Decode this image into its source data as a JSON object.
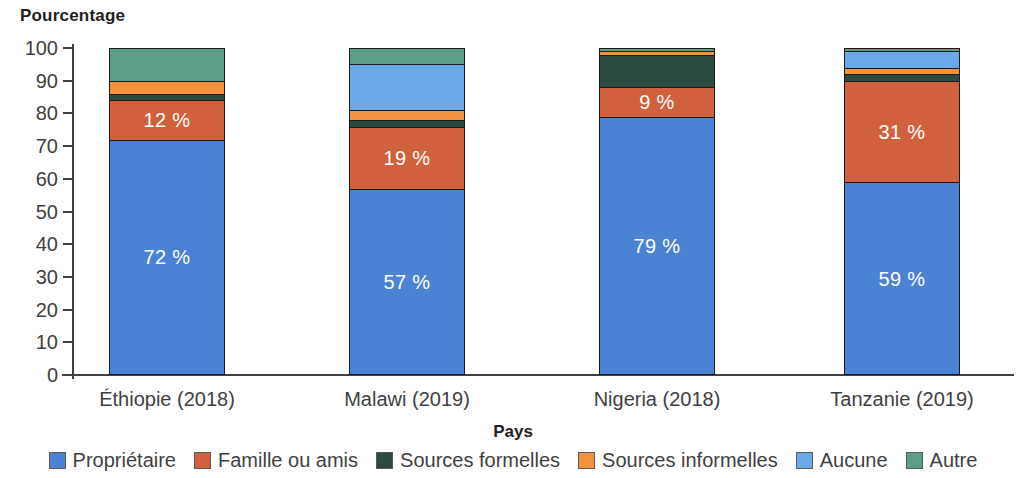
{
  "chart_data": {
    "type": "bar",
    "subtype": "stacked-bar-100",
    "title": "",
    "ylabel": "Pourcentage",
    "xlabel": "Pays",
    "ylim": [
      0,
      100
    ],
    "yticks": [
      0,
      10,
      20,
      30,
      40,
      50,
      60,
      70,
      80,
      90,
      100
    ],
    "ytick_labels": [
      "0",
      "10",
      "20",
      "30",
      "40",
      "50",
      "60",
      "70",
      "80",
      "90",
      "100"
    ],
    "grid": false,
    "legend_position": "bottom",
    "categories": [
      "Éthiopie (2018)",
      "Malawi (2019)",
      "Nigeria (2018)",
      "Tanzanie (2019)"
    ],
    "series": [
      {
        "name": "Propriétaire",
        "color": "#4a82d4",
        "values": [
          72,
          57,
          79,
          59
        ]
      },
      {
        "name": "Famille ou amis",
        "color": "#d1613c",
        "values": [
          12,
          19,
          9,
          31
        ]
      },
      {
        "name": "Sources formelles",
        "color": "#2d4a3e",
        "values": [
          2,
          2,
          10,
          2
        ]
      },
      {
        "name": "Sources informelles",
        "color": "#f2913e",
        "values": [
          4,
          3,
          1,
          2
        ]
      },
      {
        "name": "Aucune",
        "color": "#6aa8e8",
        "values": [
          0,
          14,
          0,
          5
        ]
      },
      {
        "name": "Autre",
        "color": "#5b9e85",
        "values": [
          10,
          5,
          1,
          1
        ]
      }
    ],
    "data_labels": [
      {
        "category": "Éthiopie (2018)",
        "series": "Propriétaire",
        "text": "72 %"
      },
      {
        "category": "Éthiopie (2018)",
        "series": "Famille ou amis",
        "text": "12 %"
      },
      {
        "category": "Malawi (2019)",
        "series": "Propriétaire",
        "text": "57 %"
      },
      {
        "category": "Malawi (2019)",
        "series": "Famille ou amis",
        "text": "19 %"
      },
      {
        "category": "Nigeria (2018)",
        "series": "Propriétaire",
        "text": "79 %"
      },
      {
        "category": "Nigeria (2018)",
        "series": "Famille ou amis",
        "text": "9 %"
      },
      {
        "category": "Tanzanie (2019)",
        "series": "Propriétaire",
        "text": "59 %"
      },
      {
        "category": "Tanzanie (2019)",
        "series": "Famille ou amis",
        "text": "31 %"
      }
    ]
  },
  "axis": {
    "y_title": "Pourcentage",
    "x_title": "Pays"
  },
  "legend": {
    "items": [
      {
        "label": "Propriétaire",
        "color": "#4a82d4"
      },
      {
        "label": "Famille ou amis",
        "color": "#d1613c"
      },
      {
        "label": "Sources formelles",
        "color": "#2d4a3e"
      },
      {
        "label": "Sources informelles",
        "color": "#f2913e"
      },
      {
        "label": "Aucune",
        "color": "#6aa8e8"
      },
      {
        "label": "Autre",
        "color": "#5b9e85"
      }
    ]
  }
}
